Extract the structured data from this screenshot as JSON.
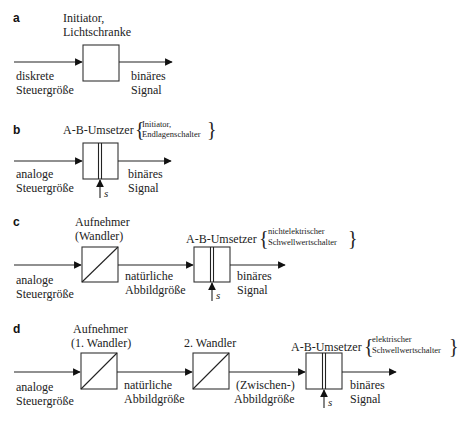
{
  "panels": {
    "a": {
      "letter": "a",
      "block_label": [
        "Initiator,",
        "Lichtschranke"
      ],
      "input_label": [
        "diskrete",
        "Steuergröße"
      ],
      "output_label": [
        "binäres",
        "Signal"
      ]
    },
    "b": {
      "letter": "b",
      "block_label": "A-B-Umsetzer",
      "block_examples": [
        "Initiator,",
        "Endlagenschalter"
      ],
      "input_label": [
        "analoge",
        "Steuergröße"
      ],
      "output_label": [
        "binäres",
        "Signal"
      ],
      "threshold_label": "s"
    },
    "c": {
      "letter": "c",
      "sensor_label": [
        "Aufnehmer",
        "(Wandler)"
      ],
      "converter_label": "A-B-Umsetzer",
      "converter_examples": [
        "nichtelektrischer",
        "Schwellwertschalter"
      ],
      "input_label": [
        "analoge",
        "Steuergröße"
      ],
      "middle_label": [
        "natürliche",
        "Abbildgröße"
      ],
      "output_label": [
        "binäres",
        "Signal"
      ],
      "threshold_label": "s"
    },
    "d": {
      "letter": "d",
      "sensor_label": [
        "Aufnehmer",
        "(1. Wandler)"
      ],
      "second_converter_label": "2. Wandler",
      "converter_label": "A-B-Umsetzer",
      "converter_examples": [
        "elektrischer",
        "Schwellwertschalter"
      ],
      "input_label": [
        "analoge",
        "Steuergröße"
      ],
      "middle_label_1": [
        "natürliche",
        "Abbildgröße"
      ],
      "middle_label_2": [
        "(Zwischen-)",
        "Abbildgröße"
      ],
      "output_label": [
        "binäres",
        "Signal"
      ],
      "threshold_label": "s"
    }
  },
  "braces": {
    "open": "{",
    "close": "}"
  }
}
